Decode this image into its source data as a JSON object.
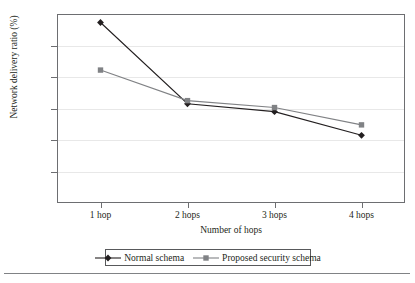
{
  "chart_data": {
    "type": "line",
    "title": "",
    "xlabel": "Number of hops",
    "ylabel": "Network delivery ratio (%)",
    "categories": [
      "1 hop",
      "2 hops",
      "3 hops",
      "4 hops"
    ],
    "ylim": [
      40,
      100
    ],
    "ytick_step": 10,
    "yticks": [
      100,
      90,
      80,
      70,
      60,
      50,
      40
    ],
    "grid": true,
    "legend_position": "bottom",
    "series": [
      {
        "name": "Normal schema",
        "values": [
          97.3,
          71.5,
          69.0,
          61.5
        ],
        "color": "#231f20",
        "marker": "diamond"
      },
      {
        "name": "Proposed security schema",
        "values": [
          82.2,
          72.5,
          70.3,
          64.8
        ],
        "color": "#808285",
        "marker": "square"
      }
    ]
  },
  "axes": {
    "y_title": "Network delivery ratio (%)",
    "x_title": "Number of hops",
    "y_labels": [
      "100",
      "90",
      "80",
      "70",
      "60",
      "50",
      "40"
    ],
    "x_labels": [
      "1 hop",
      "2 hops",
      "3 hops",
      "4 hops"
    ]
  },
  "legend": {
    "entries": [
      {
        "label": "Normal schema",
        "color": "#231f20",
        "marker": "diamond-marker-icon"
      },
      {
        "label": "Proposed security schema",
        "color": "#808285",
        "marker": "square-marker-icon"
      }
    ]
  },
  "colors": {
    "series_primary": "#231f20",
    "series_secondary": "#808285",
    "axis": "#6d6e71",
    "grid": "#e8e8e8",
    "rule": "#808285"
  }
}
